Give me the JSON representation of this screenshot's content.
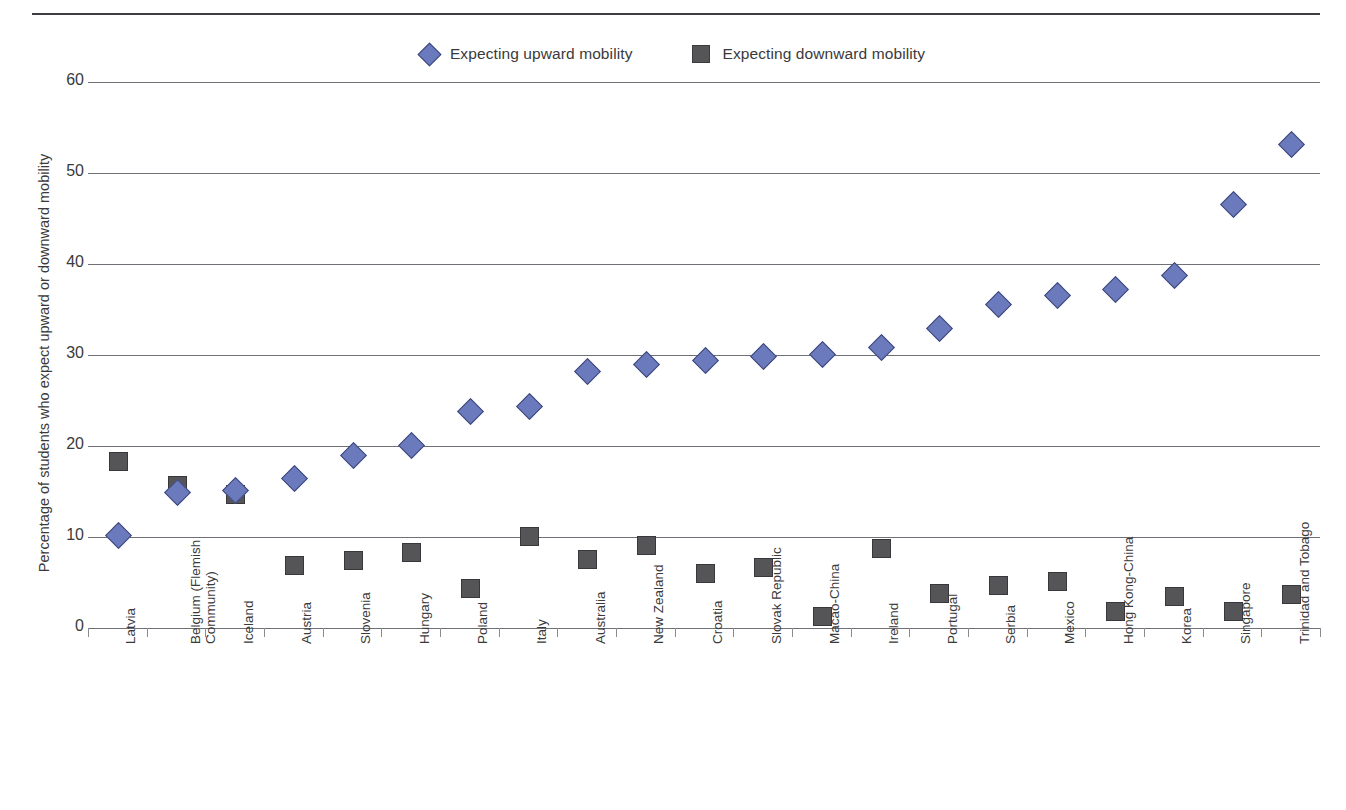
{
  "legend": {
    "items": [
      {
        "label": "Expecting upward mobility",
        "marker": "diamond-marker",
        "color": "#6b79bd"
      },
      {
        "label": "Expecting downward mobility",
        "marker": "square-marker",
        "color": "#555558"
      }
    ]
  },
  "chart_data": {
    "type": "scatter",
    "title": "",
    "xlabel": "",
    "ylabel": "Percentage of students who expect upward or downward mobility",
    "ylim": [
      0,
      60
    ],
    "yticks": [
      0,
      10,
      20,
      30,
      40,
      50,
      60
    ],
    "ytick_labels": [
      "0",
      "10",
      "20",
      "30",
      "40",
      "50",
      "60"
    ],
    "grid": "horizontal",
    "legend_position": "top-center",
    "categories": [
      "Latvia",
      "Belgium (Flemish Community)",
      "Iceland",
      "Austria",
      "Slovenia",
      "Hungary",
      "Poland",
      "Italy",
      "Australia",
      "New Zealand",
      "Croatia",
      "Slovak Republic",
      "Macao-China",
      "Ireland",
      "Portugal",
      "Serbia",
      "Mexico",
      "Hong Kong-China",
      "Korea",
      "Singapore",
      "Trinidad and Tobago"
    ],
    "category_lines": [
      [
        "Latvia"
      ],
      [
        "Belgium (Flemish",
        "Community)"
      ],
      [
        "Iceland"
      ],
      [
        "Austria"
      ],
      [
        "Slovenia"
      ],
      [
        "Hungary"
      ],
      [
        "Poland"
      ],
      [
        "Italy"
      ],
      [
        "Australia"
      ],
      [
        "New Zealand"
      ],
      [
        "Croatia"
      ],
      [
        "Slovak Republic"
      ],
      [
        "Macao-China"
      ],
      [
        "Ireland"
      ],
      [
        "Portugal"
      ],
      [
        "Serbia"
      ],
      [
        "Mexico"
      ],
      [
        "Hong Kong-China"
      ],
      [
        "Korea"
      ],
      [
        "Singapore"
      ],
      [
        "Trinidad and Tobago"
      ]
    ],
    "series": [
      {
        "name": "Expecting upward mobility",
        "marker": "diamond",
        "color": "#6b79bd",
        "values": [
          10.3,
          15.0,
          15.2,
          16.5,
          19.1,
          20.2,
          23.9,
          24.5,
          28.3,
          29.1,
          29.5,
          29.9,
          30.2,
          30.9,
          33.0,
          35.7,
          36.7,
          37.3,
          38.8,
          46.7,
          53.2
        ]
      },
      {
        "name": "Expecting downward mobility",
        "marker": "square",
        "color": "#555558",
        "values": [
          18.4,
          15.8,
          14.8,
          7.0,
          7.5,
          8.4,
          4.5,
          10.2,
          7.6,
          9.2,
          6.1,
          6.8,
          1.4,
          8.8,
          3.9,
          4.8,
          5.2,
          1.9,
          3.6,
          1.9,
          3.8
        ]
      }
    ]
  }
}
